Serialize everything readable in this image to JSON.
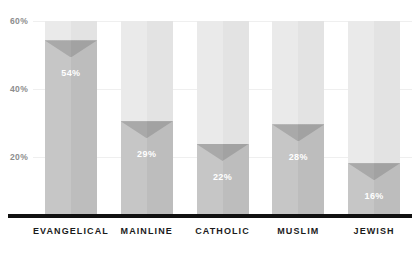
{
  "chart_data": {
    "type": "bar",
    "title": "",
    "xlabel": "",
    "ylabel": "",
    "categories": [
      "EVANGELICAL",
      "MAINLINE",
      "CATHOLIC",
      "MUSLIM",
      "JEWISH"
    ],
    "values": [
      54,
      29,
      22,
      28,
      16
    ],
    "value_labels": [
      "54%",
      "29%",
      "22%",
      "28%",
      "16%"
    ],
    "ylim": [
      0,
      60
    ],
    "yticks": [
      60,
      40,
      20
    ],
    "ytick_labels": [
      "60%",
      "40%",
      "20%"
    ],
    "grid": true,
    "legend": "none",
    "units": "percent",
    "track_max": 60,
    "colors": {
      "bar_fill": "#c6c6c6",
      "bar_fill_shade": "#bdbdbd",
      "bar_notch": "#a9a9a9",
      "bar_track": "#eaeaea",
      "bar_track_shade": "#e3e3e3",
      "baseline": "#111111",
      "gridline": "#efefef",
      "tick_text": "#8d8d8d",
      "category_text": "#1b1b1b",
      "value_text": "#ffffff"
    }
  },
  "axis": {
    "tick_60": "60%",
    "tick_40": "40%",
    "tick_20": "20%"
  },
  "bars": [
    {
      "category": "EVANGELICAL",
      "value": 54,
      "label": "54%"
    },
    {
      "category": "MAINLINE",
      "value": 29,
      "label": "29%"
    },
    {
      "category": "CATHOLIC",
      "value": 22,
      "label": "22%"
    },
    {
      "category": "MUSLIM",
      "value": 28,
      "label": "28%"
    },
    {
      "category": "JEWISH",
      "value": 16,
      "label": "16%"
    }
  ],
  "title_fragment": ""
}
